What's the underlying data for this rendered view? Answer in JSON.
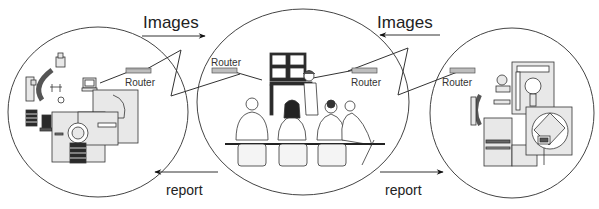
{
  "diagram": {
    "type": "teleradiology-network",
    "nodes": [
      {
        "id": "left-site",
        "label": "Imaging equipment site",
        "router_label": "Router"
      },
      {
        "id": "center-site",
        "label": "Reading room / conference",
        "router_left_label": "Router",
        "router_right_label": "Router"
      },
      {
        "id": "right-site",
        "label": "Imaging equipment site",
        "router_label": "Router"
      }
    ],
    "arrows": {
      "top_left": {
        "label": "Images",
        "direction": "right"
      },
      "top_right": {
        "label": "Images",
        "direction": "left"
      },
      "bottom_left": {
        "label": "report",
        "direction": "left"
      },
      "bottom_right": {
        "label": "report",
        "direction": "right"
      }
    },
    "colors": {
      "line": "#333333",
      "equipment_fill": "#e8e8e8",
      "equipment_dark": "#2a2a2a",
      "router_fill": "#bdbdbd"
    }
  }
}
